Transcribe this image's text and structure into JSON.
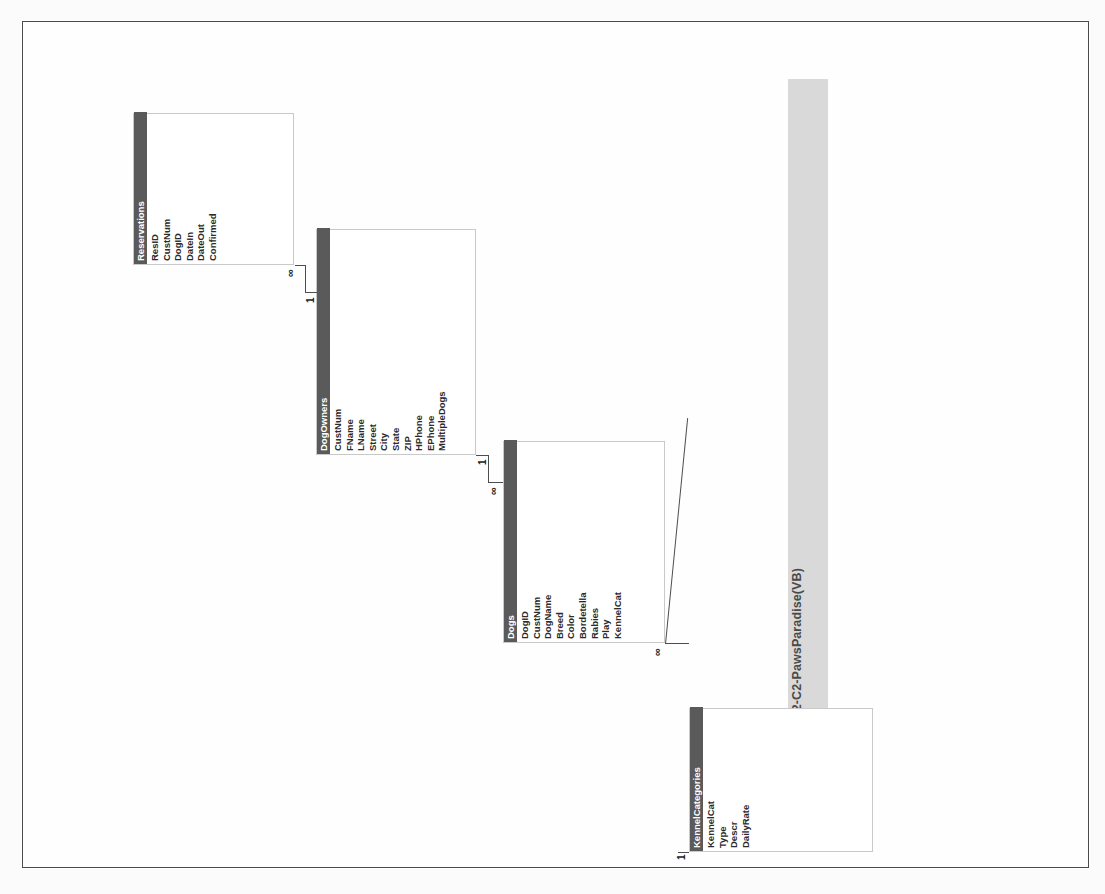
{
  "report": {
    "title": "Relationships for AL2-C2-PawsParadise(VB)",
    "date": "Sunday, April 21, 2013"
  },
  "colors": {
    "header_bar": "#5a5a5a",
    "table_border": "#c9c9c9",
    "title_band": "#d2d2d2",
    "page_border": "#4a4a4a",
    "relationship_line": "#4d4d4d"
  },
  "tables": [
    {
      "id": "reservations",
      "name": "Reservations",
      "fields": [
        "ResID",
        "CustNum",
        "DogID",
        "DateIn",
        "DateOut",
        "Confirmed"
      ]
    },
    {
      "id": "dogowners",
      "name": "DogOwners",
      "fields": [
        "CustNum",
        "FName",
        "LName",
        "Street",
        "City",
        "State",
        "ZIP",
        "HPhone",
        "EPhone",
        "MultipleDogs"
      ]
    },
    {
      "id": "dogs",
      "name": "Dogs",
      "fields": [
        "DogID",
        "CustNum",
        "DogName",
        "Breed",
        "Color",
        "Bordetella",
        "Rabies",
        "Play",
        "KennelCat"
      ]
    },
    {
      "id": "kennelcategories",
      "name": "KennelCategories",
      "fields": [
        "KennelCat",
        "Type",
        "Descr",
        "DailyRate"
      ]
    }
  ],
  "relationships": [
    {
      "id": "dogowners-reservations",
      "from_table": "DogOwners",
      "from_field": "CustNum",
      "from_cardinality": "1",
      "to_table": "Reservations",
      "to_field": "CustNum",
      "to_cardinality": "∞"
    },
    {
      "id": "dogowners-dogs",
      "from_table": "DogOwners",
      "from_field": "CustNum",
      "from_cardinality": "1",
      "to_table": "Dogs",
      "to_field": "CustNum",
      "to_cardinality": "∞"
    },
    {
      "id": "kennelcategories-dogs",
      "from_table": "KennelCategories",
      "from_field": "KennelCat",
      "from_cardinality": "1",
      "to_table": "Dogs",
      "to_field": "KennelCat",
      "to_cardinality": "∞"
    }
  ]
}
